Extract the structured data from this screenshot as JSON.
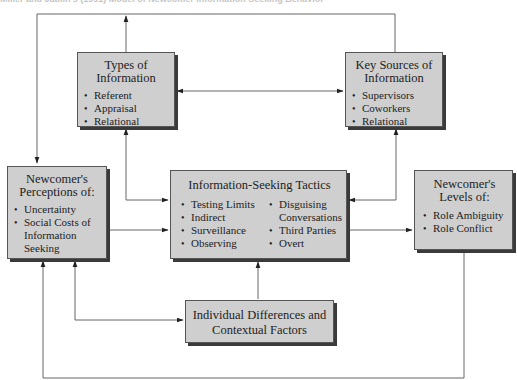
{
  "title": "Miller and Jablin's (1991) Model of Newcomer Information Seeking Behavior",
  "boxes": {
    "types": {
      "title": "Types of Information",
      "title_lines": [
        "Types of",
        "Information"
      ],
      "items": [
        "Referent",
        "Appraisal",
        "Relational"
      ]
    },
    "sources": {
      "title": "Key Sources of Information",
      "title_lines": [
        "Key Sources of",
        "Information"
      ],
      "items": [
        "Supervisors",
        "Coworkers",
        "Relational"
      ]
    },
    "perceptions": {
      "title": "Newcomer's Perceptions of:",
      "title_lines": [
        "Newcomer's",
        "Perceptions of:"
      ],
      "items": [
        "Uncertainty",
        "Social Costs of Information Seeking"
      ]
    },
    "tactics": {
      "title": "Information-Seeking Tactics",
      "items_left": [
        "Testing Limits",
        "Indirect",
        "Surveillance",
        "Observing"
      ],
      "items_right": [
        "Disguising Conversations",
        "Third Parties",
        "Overt"
      ]
    },
    "levels": {
      "title": "Newcomer's Levels of:",
      "title_lines": [
        "Newcomer's",
        "Levels of:"
      ],
      "items": [
        "Role Ambiguity",
        "Role Conflict"
      ]
    },
    "individual": {
      "title": "Individual Differences and Contextual Factors",
      "title_lines": [
        "Individual Differences and",
        "Contextual Factors"
      ]
    }
  },
  "connections": [
    {
      "from": "types",
      "to": "sources",
      "direction": "bidirectional"
    },
    {
      "from": "types",
      "to": "tactics",
      "direction": "bidirectional"
    },
    {
      "from": "sources",
      "to": "tactics",
      "direction": "bidirectional"
    },
    {
      "from": "sources",
      "to": "perceptions",
      "direction": "one-way",
      "via": "top line"
    },
    {
      "from": "perceptions",
      "to": "tactics",
      "direction": "one-way"
    },
    {
      "from": "tactics",
      "to": "levels",
      "direction": "one-way"
    },
    {
      "from": "individual",
      "to": "tactics",
      "direction": "one-way"
    },
    {
      "from": "individual",
      "to": "perceptions",
      "direction": "bidirectional"
    },
    {
      "from": "levels",
      "to": "perceptions",
      "direction": "one-way",
      "via": "bottom feedback line"
    }
  ],
  "colors": {
    "box_fill": "#cfcfcf",
    "box_border": "#555555",
    "box_shadow": "#3a3a3a",
    "line": "#666666",
    "arrow": "#222222"
  }
}
